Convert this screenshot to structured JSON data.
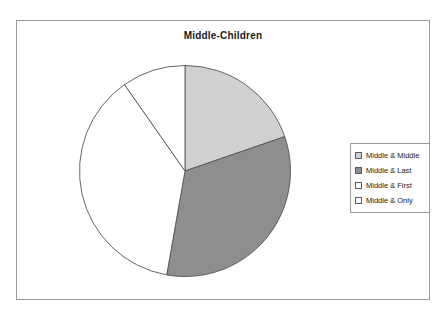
{
  "chart_data": {
    "type": "pie",
    "title": "Middle-Children",
    "xlabel": "",
    "ylabel": "",
    "legend_position": "right",
    "grid": false,
    "categories": [
      "Middle & Middle",
      "Middle & Last",
      "Middle & First",
      "Middle & Only"
    ],
    "values": [
      19.7,
      33.1,
      37.6,
      9.6
    ],
    "units": "percent",
    "start_angle_deg": 0,
    "direction": "clockwise",
    "slices": [
      {
        "label": "Middle & Middle",
        "value": 19.7,
        "angle_deg": 71,
        "color": "#d0d0d0"
      },
      {
        "label": "Middle & Last",
        "value": 33.1,
        "angle_deg": 119,
        "color": "#8e8e8e"
      },
      {
        "label": "Middle & First",
        "value": 37.6,
        "angle_deg": 135,
        "color": "#ffffff"
      },
      {
        "label": "Middle & Only",
        "value": 9.6,
        "angle_deg": 35,
        "color": "#ffffff"
      }
    ]
  },
  "legend": {
    "items": [
      {
        "label": "Middle & Middle",
        "color": "#d0d0d0"
      },
      {
        "label": "Middle & Last",
        "color": "#8e8e8e"
      },
      {
        "label": "Middle & First",
        "color": "#ffffff"
      },
      {
        "label": "Middle & Only",
        "color": "#ffffff"
      }
    ]
  },
  "colors": {
    "slice_border": "#555555",
    "frame_border": "#9a9a9a",
    "text": "#1a1a1a",
    "background": "#ffffff"
  }
}
